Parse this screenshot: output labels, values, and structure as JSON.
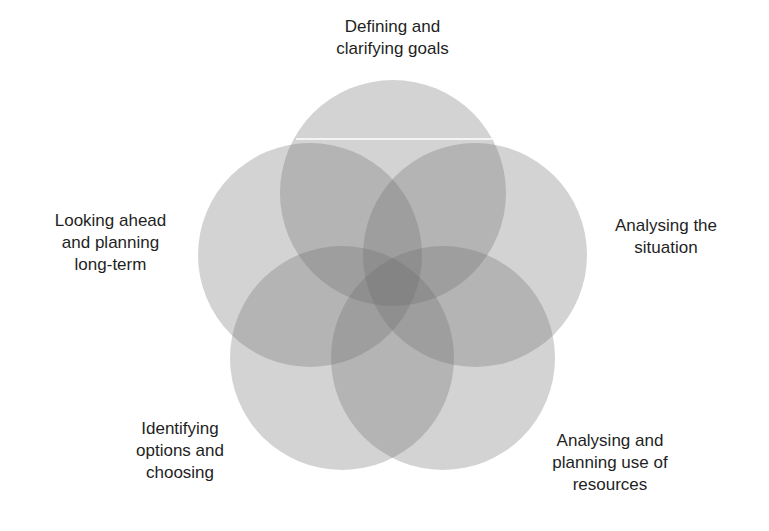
{
  "diagram": {
    "type": "five-circle-venn",
    "circle_fill": "#6e6e6e",
    "circle_opacity": 0.3,
    "background": "#ffffff",
    "circles": [
      {
        "id": "goals",
        "cx": 393,
        "cy": 193,
        "r": 113
      },
      {
        "id": "situation",
        "cx": 475,
        "cy": 255,
        "r": 112
      },
      {
        "id": "resources",
        "cx": 443,
        "cy": 358,
        "r": 112
      },
      {
        "id": "options",
        "cx": 342,
        "cy": 358,
        "r": 112
      },
      {
        "id": "long-term",
        "cx": 310,
        "cy": 255,
        "r": 112
      }
    ],
    "labels": [
      "Defining and\nclarifying goals",
      "Analysing the\nsituation",
      "Analysing and\nplanning use of\nresources",
      "Identifying\noptions and\nchoosing",
      "Looking ahead\nand planning\nlong-term"
    ]
  }
}
